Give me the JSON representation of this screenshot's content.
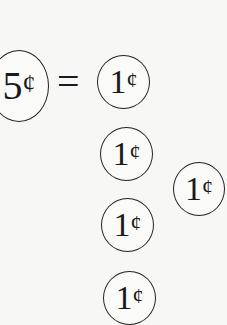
{
  "equation": {
    "left_coin": {
      "value": "5",
      "unit": "¢"
    },
    "operator": "=",
    "right_coins": [
      {
        "value": "1",
        "unit": "¢"
      },
      {
        "value": "1",
        "unit": "¢"
      },
      {
        "value": "1",
        "unit": "¢"
      },
      {
        "value": "1",
        "unit": "¢"
      },
      {
        "value": "1",
        "unit": "¢"
      }
    ]
  }
}
